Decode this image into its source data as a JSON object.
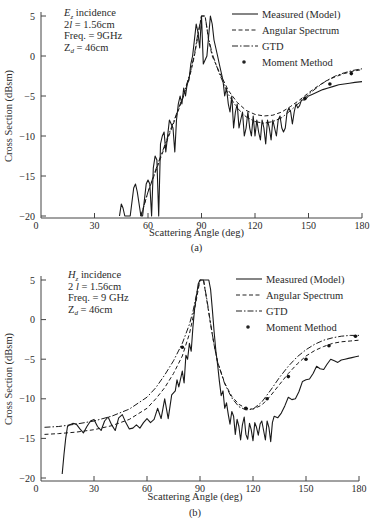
{
  "chart_data": [
    {
      "id": "a",
      "type": "line",
      "caption": "(a)",
      "xlabel": "Scattering Angle (deg)",
      "ylabel": "Cross Section (dBsm)",
      "xlim": [
        0,
        180
      ],
      "ylim": [
        -20,
        5
      ],
      "xticks": [
        0,
        30,
        60,
        90,
        120,
        150,
        180
      ],
      "yticks": [
        5,
        0,
        -5,
        -10,
        -15,
        -20
      ],
      "grid": false,
      "legend_position": "upper right",
      "annotation": [
        "E_z incidence",
        "2l = 1.56cm",
        "Freq. = 9GHz",
        "Z_d = 46cm"
      ],
      "series": [
        {
          "name": "Measured (Model)",
          "style": "solid",
          "x": [
            44,
            45,
            46,
            47,
            50,
            52,
            53,
            54,
            56,
            57,
            59,
            60,
            61,
            62,
            63,
            64,
            65,
            66,
            67,
            68,
            69,
            70,
            71,
            72,
            73,
            74,
            75,
            76,
            77,
            78,
            79,
            80,
            81,
            82,
            83,
            84,
            85,
            86,
            87,
            88,
            89,
            90,
            91,
            93,
            95,
            96,
            97,
            98,
            99,
            100,
            101,
            102,
            103,
            104,
            105,
            106,
            107,
            108,
            109,
            110,
            111,
            112,
            113,
            114,
            115,
            116,
            117,
            118,
            119,
            120,
            121,
            122,
            123,
            124,
            125,
            126,
            127,
            128,
            129,
            130,
            131,
            132,
            133,
            134,
            135,
            136,
            137,
            138,
            139,
            140,
            141,
            142,
            143,
            144,
            145,
            146,
            148,
            150,
            152,
            155,
            158,
            161,
            164,
            167,
            170,
            173,
            176,
            180
          ],
          "y": [
            -20,
            -18.5,
            -19,
            -20,
            -20,
            -16.5,
            -16,
            -17,
            -20,
            -20,
            -16,
            -15.5,
            -16,
            -20,
            -14,
            -12.5,
            -13,
            -20,
            -11,
            -10,
            -9.5,
            -12,
            -10,
            -8,
            -8.5,
            -9,
            -12,
            -8,
            -6,
            -5,
            -6,
            -4,
            -5,
            -3.5,
            -3,
            -1,
            0,
            2,
            4,
            3,
            1,
            5,
            -1,
            0,
            5,
            4,
            2,
            1,
            0,
            -1,
            -2,
            -3,
            -5,
            -4,
            -6,
            -7,
            -5,
            -9,
            -7,
            -6,
            -9,
            -8,
            -7,
            -10,
            -9,
            -7,
            -9,
            -10,
            -7.5,
            -10,
            -8,
            -9.5,
            -10.5,
            -8,
            -9,
            -11,
            -8,
            -9,
            -10.5,
            -8,
            -9,
            -10,
            -8,
            -7.5,
            -9,
            -9.5,
            -9,
            -7,
            -6.5,
            -7,
            -8.5,
            -7,
            -6,
            -6.5,
            -6.2,
            -5.5,
            -5.5,
            -5,
            -4.8,
            -4.5,
            -4.2,
            -4,
            -3.8,
            -3.6,
            -3.5,
            -3.4,
            -3.3,
            -3.2
          ]
        },
        {
          "name": "Angular Spectrum",
          "style": "dashed",
          "x": [
            56,
            60,
            65,
            70,
            75,
            80,
            84,
            86,
            88,
            90,
            92,
            94,
            96,
            100,
            105,
            110,
            115,
            120,
            125,
            130,
            135,
            140,
            145,
            150,
            155,
            160,
            165,
            170,
            175,
            180
          ],
          "y": [
            -20,
            -17,
            -14,
            -11,
            -8,
            -5,
            -2,
            0,
            2.5,
            5,
            5,
            2,
            0,
            -2,
            -4.3,
            -5.8,
            -6.8,
            -7.3,
            -7.5,
            -7.4,
            -7,
            -6.3,
            -5.5,
            -4.6,
            -3.8,
            -3.1,
            -2.6,
            -2.2,
            -1.9,
            -1.7
          ]
        },
        {
          "name": "GTD",
          "style": "dashdot",
          "x": [
            56,
            60,
            65,
            70,
            75,
            80,
            84,
            86,
            88,
            90,
            92,
            94,
            96,
            100,
            105,
            110,
            115,
            120,
            125,
            130,
            135,
            140,
            145,
            150,
            155,
            160,
            165,
            170,
            175,
            180
          ],
          "y": [
            -20,
            -17,
            -13.8,
            -10.8,
            -7.8,
            -4.8,
            -1.8,
            0.2,
            2.8,
            5,
            5,
            2.2,
            0.3,
            -2.2,
            -4.8,
            -6.5,
            -7.6,
            -8.2,
            -8.4,
            -8.2,
            -7.7,
            -6.8,
            -5.8,
            -4.8,
            -3.9,
            -3.1,
            -2.5,
            -2.1,
            -1.8,
            -1.6
          ]
        },
        {
          "name": "Moment Method",
          "style": "dots",
          "x": [
            148,
            162,
            174
          ],
          "y": [
            -5.3,
            -3.5,
            -2.2
          ]
        }
      ]
    },
    {
      "id": "b",
      "type": "line",
      "caption": "(b)",
      "xlabel": "Scattering Angle (deg)",
      "ylabel": "Cross Section (dBsm)",
      "xlim": [
        0,
        180
      ],
      "ylim": [
        -20,
        5
      ],
      "xticks": [
        0,
        30,
        60,
        90,
        120,
        150,
        180
      ],
      "yticks": [
        5,
        0,
        -5,
        -10,
        -15,
        -20
      ],
      "grid": false,
      "legend_position": "upper right",
      "annotation": [
        "H_z incidence",
        "2 l = 1.56cm",
        "Freq. = 9 GHz",
        "Z_d = 46cm"
      ],
      "series": [
        {
          "name": "Measured (Model)",
          "style": "solid",
          "x": [
            12,
            13,
            14,
            15,
            16,
            18,
            20,
            22,
            24,
            26,
            28,
            30,
            32,
            34,
            36,
            38,
            40,
            42,
            44,
            46,
            48,
            50,
            52,
            54,
            56,
            58,
            60,
            62,
            64,
            66,
            68,
            70,
            72,
            74,
            76,
            77,
            78,
            80,
            81,
            82,
            83,
            84,
            85,
            86,
            87,
            88,
            89,
            90,
            95,
            96,
            97,
            98,
            99,
            100,
            101,
            102,
            103,
            104,
            105,
            106,
            107,
            108,
            109,
            110,
            111,
            112,
            113,
            114,
            115,
            116,
            117,
            118,
            119,
            120,
            121,
            122,
            123,
            124,
            125,
            126,
            127,
            128,
            129,
            130,
            131,
            132,
            134,
            136,
            138,
            140,
            142,
            144,
            146,
            148,
            150,
            152,
            154,
            156,
            158,
            160,
            162,
            164,
            166,
            168,
            170,
            172,
            174,
            176,
            178,
            180
          ],
          "y": [
            -19.5,
            -17,
            -15,
            -13.5,
            -13.3,
            -13.1,
            -13.2,
            -13.8,
            -14.3,
            -13.5,
            -12.8,
            -12.6,
            -13.5,
            -14,
            -12.8,
            -12.3,
            -13.3,
            -14,
            -12.4,
            -12,
            -13,
            -13.8,
            -13.7,
            -13.3,
            -13.7,
            -13,
            -12.5,
            -13,
            -12.6,
            -11.2,
            -12.5,
            -10,
            -12.5,
            -9.5,
            -9,
            -7.6,
            -8.5,
            -6.5,
            -8,
            -4.5,
            -5,
            -3,
            -4,
            -1,
            1.5,
            3,
            4.5,
            5,
            5,
            3.8,
            1.2,
            -1.5,
            -4,
            -5.8,
            -7.8,
            -9.6,
            -9,
            -11.2,
            -10.5,
            -12,
            -13.2,
            -11.6,
            -12.2,
            -14.5,
            -12.6,
            -13.5,
            -15.2,
            -13.3,
            -12.3,
            -14.5,
            -15.1,
            -13.1,
            -13.9,
            -15.3,
            -13,
            -13.6,
            -14.6,
            -13.2,
            -12.8,
            -14,
            -15.2,
            -12.8,
            -13.6,
            -15.4,
            -13,
            -12.2,
            -12.4,
            -11.8,
            -10.9,
            -9.8,
            -10.1,
            -10,
            -9.1,
            -7.8,
            -7.6,
            -7.5,
            -6.8,
            -5.9,
            -6.2,
            -6.3,
            -5.6,
            -5,
            -5.2,
            -5.4,
            -5.1,
            -5,
            -4.9,
            -4.8,
            -4.7,
            -4.6
          ]
        },
        {
          "name": "Angular Spectrum",
          "style": "dashed",
          "x": [
            2,
            10,
            20,
            30,
            40,
            50,
            60,
            65,
            70,
            75,
            80,
            84,
            86,
            88,
            90,
            92,
            94,
            96,
            98,
            100,
            104,
            108,
            112,
            116,
            120,
            125,
            130,
            135,
            140,
            145,
            150,
            155,
            160,
            165,
            170,
            175,
            180
          ],
          "y": [
            -14.5,
            -14.4,
            -14.2,
            -13.9,
            -13.4,
            -12.6,
            -11.2,
            -10,
            -8.6,
            -6.8,
            -4.6,
            -1.8,
            0.2,
            2.6,
            5,
            5,
            2.2,
            -0.6,
            -3.2,
            -5.4,
            -8,
            -9.7,
            -10.7,
            -11.2,
            -11.3,
            -10.8,
            -9.6,
            -8.2,
            -6.8,
            -5.6,
            -4.6,
            -3.9,
            -3.4,
            -3,
            -2.8,
            -2.7,
            -2.6
          ]
        },
        {
          "name": "GTD",
          "style": "dashdot",
          "x": [
            2,
            10,
            20,
            30,
            40,
            50,
            60,
            65,
            70,
            75,
            80,
            84,
            86,
            88,
            90,
            92,
            94,
            96,
            98,
            100,
            104,
            108,
            112,
            116,
            120,
            125,
            130,
            135,
            140,
            145,
            150,
            155,
            160,
            165,
            170,
            175,
            180
          ],
          "y": [
            -13.6,
            -13.5,
            -13.2,
            -12.8,
            -12.2,
            -11.3,
            -9.8,
            -8.6,
            -7,
            -5.2,
            -3,
            -0.6,
            1,
            3.2,
            5,
            5,
            2.4,
            -0.5,
            -3.2,
            -5.4,
            -8.1,
            -9.9,
            -11,
            -11.4,
            -11.3,
            -10.4,
            -8.9,
            -7.3,
            -5.9,
            -4.7,
            -3.8,
            -3.1,
            -2.6,
            -2.3,
            -2.1,
            -2,
            -2
          ]
        },
        {
          "name": "Moment Method",
          "style": "dots",
          "x": [
            80,
            116,
            128,
            140,
            150,
            163,
            178
          ],
          "y": [
            -3.5,
            -11.2,
            -10,
            -7.2,
            -5,
            -3.3,
            -2.1
          ]
        }
      ]
    }
  ],
  "legend_labels": [
    "Measured (Model)",
    "Angular Spectrum",
    "GTD",
    "Moment Method"
  ]
}
